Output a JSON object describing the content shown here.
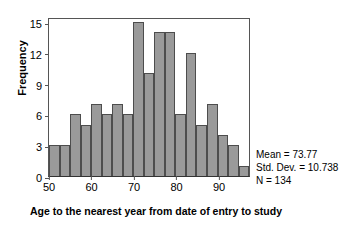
{
  "chart_data": {
    "type": "bar",
    "title": "",
    "subtitle": "",
    "xlabel": "Age to the nearest year from date of entry to study",
    "ylabel": "Frequency",
    "xlim": [
      50,
      97.5
    ],
    "ylim": [
      0,
      15.5
    ],
    "bin_width": 2.5,
    "grid": false,
    "legend_position": "none",
    "xticks": [
      "50",
      "60",
      "70",
      "80",
      "90"
    ],
    "xtick_values": [
      50,
      60,
      70,
      80,
      90
    ],
    "yticks": [
      "0",
      "3",
      "6",
      "9",
      "12",
      "15"
    ],
    "ytick_values": [
      0,
      3,
      6,
      9,
      12,
      15
    ],
    "bin_starts": [
      50,
      52.5,
      55,
      57.5,
      60,
      62.5,
      65,
      67.5,
      70,
      72.5,
      75,
      77.5,
      80,
      82.5,
      85,
      87.5,
      90,
      92.5,
      95
    ],
    "categories": [
      "50-52.5",
      "52.5-55",
      "55-57.5",
      "57.5-60",
      "60-62.5",
      "62.5-65",
      "65-67.5",
      "67.5-70",
      "70-72.5",
      "72.5-75",
      "75-77.5",
      "77.5-80",
      "80-82.5",
      "82.5-85",
      "85-87.5",
      "87.5-90",
      "90-92.5",
      "92.5-95",
      "95-97.5"
    ],
    "values": [
      3,
      3,
      6,
      5,
      7,
      6,
      7,
      6,
      15,
      10,
      14,
      14,
      6,
      12,
      5,
      7,
      4,
      3,
      1
    ],
    "bar_color": "#9a9a9a",
    "bar_edge_color": "#4d4d4d",
    "axis_color": "#555555"
  },
  "stats": {
    "mean": "Mean = 73.77",
    "std_dev": "Std. Dev. = 10.738",
    "n": "N = 134"
  }
}
